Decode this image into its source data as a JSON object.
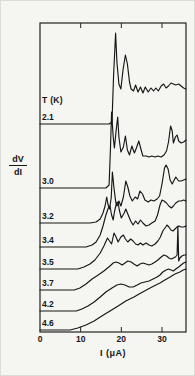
{
  "figure": {
    "series_header": "T (K)",
    "xlabel": "I (μA)",
    "ylabel_top": "dV",
    "ylabel_bottom": "dI",
    "curve_color": "#161616",
    "frame_color": "#222222",
    "background": "#f5f5f1"
  },
  "chart_data": {
    "type": "line",
    "title": "",
    "xlabel": "I (μA)",
    "ylabel": "dV/dI (arbitrary units, curves vertically offset)",
    "xlim": [
      0,
      36
    ],
    "x_ticks": [
      0,
      10,
      20,
      30
    ],
    "grid": false,
    "legend_position": "temperature labels at left end of each curve",
    "temperatures_K": [
      2.1,
      3.0,
      3.2,
      3.4,
      3.5,
      3.7,
      4.2,
      4.6
    ],
    "y_units_note": "y values are arbitrary units measured as height above the x-axis; each curve sits on its own offset baseline",
    "series": [
      {
        "name": "2.1",
        "points": [
          [
            0,
            208
          ],
          [
            14.8,
            208
          ],
          [
            17,
            208
          ],
          [
            17.7,
            210
          ],
          [
            18.1,
            257
          ],
          [
            18.6,
            299
          ],
          [
            18.9,
            270
          ],
          [
            19.4,
            248
          ],
          [
            19.9,
            243
          ],
          [
            20.4,
            262
          ],
          [
            21,
            277
          ],
          [
            21.5,
            268
          ],
          [
            22,
            250
          ],
          [
            22.4,
            243
          ],
          [
            23,
            241
          ],
          [
            23.5,
            247
          ],
          [
            24.1,
            240
          ],
          [
            24.7,
            245
          ],
          [
            25.3,
            239
          ],
          [
            25.9,
            245
          ],
          [
            26.6,
            240
          ],
          [
            27.3,
            244
          ],
          [
            27.9,
            241
          ],
          [
            28.5,
            244
          ],
          [
            29.1,
            241
          ],
          [
            29.8,
            246
          ],
          [
            30.4,
            248
          ],
          [
            31,
            244
          ],
          [
            31.6,
            246
          ],
          [
            32.2,
            249
          ],
          [
            32.8,
            248
          ],
          [
            33.4,
            247
          ],
          [
            34.1,
            248
          ],
          [
            34.7,
            246
          ],
          [
            35.3,
            244
          ],
          [
            35.9,
            243
          ]
        ]
      },
      {
        "name": "3.0",
        "points": [
          [
            0,
            144
          ],
          [
            14.8,
            144
          ],
          [
            16.2,
            144
          ],
          [
            17,
            147
          ],
          [
            17.3,
            182
          ],
          [
            17.6,
            220
          ],
          [
            18,
            195
          ],
          [
            18.3,
            184
          ],
          [
            18.7,
            201
          ],
          [
            19.1,
            215
          ],
          [
            19.4,
            195
          ],
          [
            19.9,
            180
          ],
          [
            20.5,
            185
          ],
          [
            21,
            196
          ],
          [
            21.5,
            182
          ],
          [
            22,
            177
          ],
          [
            22.6,
            186
          ],
          [
            23.2,
            179
          ],
          [
            23.7,
            184
          ],
          [
            24.3,
            191
          ],
          [
            24.8,
            183
          ],
          [
            25.3,
            176
          ],
          [
            26.1,
            176
          ],
          [
            26.8,
            175
          ],
          [
            27.5,
            176
          ],
          [
            28.3,
            175
          ],
          [
            29,
            176
          ],
          [
            29.8,
            175
          ],
          [
            30.5,
            177
          ],
          [
            31.1,
            181
          ],
          [
            31.6,
            190
          ],
          [
            32.1,
            206
          ],
          [
            32.5,
            201
          ],
          [
            32.8,
            189
          ],
          [
            33.3,
            195
          ],
          [
            33.7,
            197
          ],
          [
            34.1,
            191
          ],
          [
            34.7,
            189
          ],
          [
            35.3,
            190
          ],
          [
            35.9,
            192
          ]
        ]
      },
      {
        "name": "3.2",
        "points": [
          [
            0,
            109
          ],
          [
            12.3,
            109
          ],
          [
            13.8,
            110
          ],
          [
            14.8,
            113
          ],
          [
            15.5,
            119
          ],
          [
            16,
            126
          ],
          [
            16.4,
            135
          ],
          [
            16.7,
            128
          ],
          [
            17.1,
            123
          ],
          [
            17.5,
            134
          ],
          [
            17.8,
            160
          ],
          [
            18.2,
            144
          ],
          [
            18.6,
            131
          ],
          [
            18.9,
            126
          ],
          [
            19.4,
            131
          ],
          [
            19.9,
            126
          ],
          [
            20.5,
            135
          ],
          [
            21.1,
            151
          ],
          [
            21.6,
            145
          ],
          [
            22.1,
            136
          ],
          [
            22.7,
            131
          ],
          [
            23.4,
            135
          ],
          [
            24,
            133
          ],
          [
            24.6,
            141
          ],
          [
            25.2,
            138
          ],
          [
            25.8,
            132
          ],
          [
            26.6,
            130
          ],
          [
            27.3,
            132
          ],
          [
            28,
            131
          ],
          [
            28.8,
            133
          ],
          [
            29.4,
            136
          ],
          [
            30,
            148
          ],
          [
            30.6,
            164
          ],
          [
            31,
            167
          ],
          [
            31.5,
            163
          ],
          [
            32,
            152
          ],
          [
            32.5,
            148
          ],
          [
            33,
            152
          ],
          [
            33.4,
            155
          ],
          [
            34.1,
            151
          ],
          [
            34.7,
            151
          ],
          [
            35.3,
            152
          ],
          [
            35.9,
            153
          ]
        ]
      },
      {
        "name": "3.4",
        "points": [
          [
            0,
            85
          ],
          [
            11.3,
            85
          ],
          [
            12.8,
            87
          ],
          [
            13.8,
            90
          ],
          [
            14.8,
            97
          ],
          [
            15.5,
            106
          ],
          [
            16.2,
            117
          ],
          [
            16.8,
            124
          ],
          [
            17.2,
            126
          ],
          [
            17.6,
            117
          ],
          [
            18,
            112
          ],
          [
            18.3,
            120
          ],
          [
            18.8,
            129
          ],
          [
            19.2,
            130
          ],
          [
            19.5,
            122
          ],
          [
            20,
            114
          ],
          [
            20.7,
            119
          ],
          [
            21.1,
            123
          ],
          [
            21.6,
            118
          ],
          [
            22.3,
            111
          ],
          [
            22.9,
            107
          ],
          [
            23.5,
            111
          ],
          [
            24.1,
            108
          ],
          [
            24.7,
            112
          ],
          [
            25.3,
            109
          ],
          [
            26.1,
            106
          ],
          [
            26.8,
            107
          ],
          [
            27.5,
            109
          ],
          [
            28.3,
            111
          ],
          [
            28.9,
            117
          ],
          [
            29.5,
            127
          ],
          [
            30,
            132
          ],
          [
            30.5,
            131
          ],
          [
            31.1,
            129
          ],
          [
            31.7,
            126
          ],
          [
            32.3,
            124
          ],
          [
            32.8,
            126
          ],
          [
            33.4,
            129
          ],
          [
            34.1,
            131
          ],
          [
            34.7,
            131
          ],
          [
            35.3,
            132
          ],
          [
            35.9,
            131
          ]
        ]
      },
      {
        "name": "3.5",
        "points": [
          [
            0,
            63
          ],
          [
            9.3,
            63
          ],
          [
            10.8,
            65
          ],
          [
            12.3,
            68
          ],
          [
            13.5,
            72
          ],
          [
            14.8,
            79
          ],
          [
            15.7,
            86
          ],
          [
            16.6,
            94
          ],
          [
            17.1,
            91
          ],
          [
            17.6,
            88
          ],
          [
            18.2,
            99
          ],
          [
            18.7,
            95
          ],
          [
            19.2,
            90
          ],
          [
            19.9,
            95
          ],
          [
            20.5,
            97
          ],
          [
            21,
            93
          ],
          [
            21.6,
            90
          ],
          [
            22.3,
            93
          ],
          [
            22.9,
            91
          ],
          [
            23.5,
            88
          ],
          [
            24.1,
            87
          ],
          [
            24.7,
            89
          ],
          [
            25.3,
            87
          ],
          [
            26.1,
            89
          ],
          [
            26.8,
            87
          ],
          [
            27.5,
            86
          ],
          [
            28.3,
            88
          ],
          [
            29,
            91
          ],
          [
            29.6,
            95
          ],
          [
            30.2,
            101
          ],
          [
            30.9,
            105
          ],
          [
            31.2,
            107
          ],
          [
            31.7,
            105
          ],
          [
            32.2,
            102
          ],
          [
            32.7,
            101
          ],
          [
            33.2,
            103
          ],
          [
            33.7,
            105
          ],
          [
            34.2,
            106
          ],
          [
            34.7,
            105
          ],
          [
            35.3,
            105
          ],
          [
            35.9,
            106
          ]
        ]
      },
      {
        "name": "3.7",
        "points": [
          [
            0,
            42
          ],
          [
            8.4,
            42
          ],
          [
            9.8,
            44
          ],
          [
            11.3,
            48
          ],
          [
            12.8,
            53
          ],
          [
            14.3,
            57
          ],
          [
            15.7,
            61
          ],
          [
            17.2,
            66
          ],
          [
            18,
            69
          ],
          [
            18.7,
            70
          ],
          [
            19.4,
            69
          ],
          [
            20.2,
            67
          ],
          [
            20.9,
            69
          ],
          [
            21.6,
            71
          ],
          [
            22.4,
            70
          ],
          [
            23.1,
            68
          ],
          [
            23.9,
            66
          ],
          [
            24.6,
            68
          ],
          [
            25.3,
            69
          ],
          [
            26.1,
            68
          ],
          [
            26.8,
            67
          ],
          [
            27.5,
            68
          ],
          [
            28.3,
            70
          ],
          [
            29,
            72
          ],
          [
            29.8,
            75
          ],
          [
            30.5,
            77
          ],
          [
            31.1,
            76
          ],
          [
            31.7,
            74
          ],
          [
            32.3,
            73
          ],
          [
            32.8,
            74
          ],
          [
            33.3,
            75
          ],
          [
            33.7,
            77
          ],
          [
            33.9,
            106
          ],
          [
            34.1,
            71
          ],
          [
            34.4,
            74
          ],
          [
            34.9,
            76
          ],
          [
            35.4,
            77
          ],
          [
            35.9,
            77
          ]
        ]
      },
      {
        "name": "4.2",
        "points": [
          [
            0,
            21
          ],
          [
            8.9,
            21
          ],
          [
            10.3,
            23
          ],
          [
            11.8,
            26
          ],
          [
            13.3,
            30
          ],
          [
            14.8,
            35
          ],
          [
            16.2,
            40
          ],
          [
            17.7,
            44
          ],
          [
            18.9,
            47
          ],
          [
            19.9,
            48
          ],
          [
            20.9,
            47
          ],
          [
            21.9,
            45
          ],
          [
            22.9,
            45
          ],
          [
            23.9,
            47
          ],
          [
            24.8,
            49
          ],
          [
            25.8,
            50
          ],
          [
            26.8,
            51
          ],
          [
            27.8,
            53
          ],
          [
            28.8,
            55
          ],
          [
            29.5,
            57
          ],
          [
            30.2,
            60
          ],
          [
            31,
            62
          ],
          [
            31.6,
            63
          ],
          [
            32.2,
            62
          ],
          [
            32.8,
            61
          ],
          [
            33.4,
            63
          ],
          [
            34.1,
            65
          ],
          [
            34.7,
            67
          ],
          [
            35.3,
            69
          ],
          [
            35.9,
            70
          ]
        ]
      },
      {
        "name": "4.6",
        "points": [
          [
            0,
            2
          ],
          [
            7.4,
            2
          ],
          [
            9.3,
            4
          ],
          [
            11.3,
            7
          ],
          [
            13.3,
            11
          ],
          [
            15.2,
            16
          ],
          [
            17.2,
            21
          ],
          [
            19.2,
            26
          ],
          [
            21.1,
            31
          ],
          [
            23.1,
            35
          ],
          [
            24.8,
            39
          ],
          [
            26.6,
            43
          ],
          [
            28,
            46
          ],
          [
            29.5,
            49
          ],
          [
            30.7,
            52
          ],
          [
            32,
            55
          ],
          [
            33.2,
            58
          ],
          [
            34.4,
            60
          ],
          [
            35.2,
            62
          ],
          [
            35.9,
            63
          ]
        ]
      }
    ]
  }
}
